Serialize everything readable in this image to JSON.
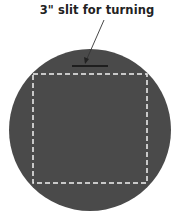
{
  "diagram": {
    "label": "3\" slit for turning",
    "colors": {
      "fabric": "#4a4a4a",
      "stitch_line": "#f2f2f2",
      "slit": "#111111",
      "arrow": "#333333",
      "text": "#222222",
      "background": "#ffffff"
    },
    "shapes": {
      "circle": "dark gray circular fabric piece",
      "dashed_square": "white dashed stitching square inside circle",
      "slit": "short black horizontal line near top of circle",
      "arrow": "thin arrow pointing from label to slit"
    }
  }
}
